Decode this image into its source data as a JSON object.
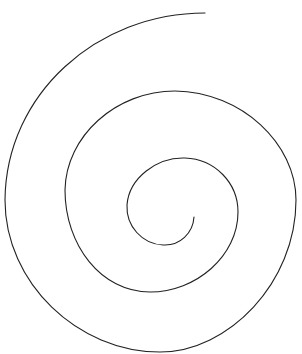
{
  "diagram": {
    "type": "spiral",
    "stroke_color": "#222222",
    "background": "#ffffff",
    "turns": 3
  }
}
